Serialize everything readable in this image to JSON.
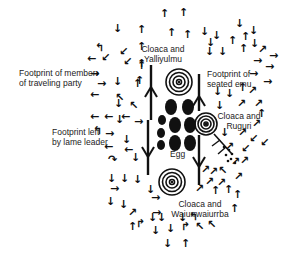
{
  "diagram": {
    "type": "annotated-figure",
    "background": "#ffffff",
    "ink": "#111111",
    "labels": [
      {
        "id": "member",
        "lines": [
          "Footprint of member",
          "of traveling party"
        ],
        "x": 19,
        "y": 75,
        "align": "left"
      },
      {
        "id": "yalliyulmu",
        "lines": [
          "Cloaca and",
          "Yalliyulmu"
        ],
        "x": 162,
        "y": 47,
        "align": "center"
      },
      {
        "id": "seated-emu",
        "lines": [
          "Footprint of",
          "seated emu"
        ],
        "x": 207,
        "y": 69,
        "align": "left"
      },
      {
        "id": "ruguri",
        "lines": [
          "Cloaca and",
          "Ruguri"
        ],
        "x": 228,
        "y": 112,
        "align": "center"
      },
      {
        "id": "lame-leader",
        "lines": [
          "Footprint left",
          "by lame leader"
        ],
        "x": 52,
        "y": 132,
        "align": "left"
      },
      {
        "id": "egg",
        "lines": [
          "Egg"
        ],
        "x": 172,
        "y": 153,
        "align": "left"
      },
      {
        "id": "wauirr",
        "lines": [
          "Cloaca and",
          "Waiurrwaiurrba"
        ],
        "x": 198,
        "y": 200,
        "align": "center"
      }
    ],
    "concentric_circles": [
      {
        "id": "yalliyulmu-cloaca",
        "cx": 179,
        "cy": 82,
        "r": 14,
        "rings": 4
      },
      {
        "id": "ruguri-cloaca",
        "cx": 206,
        "cy": 124,
        "r": 12,
        "rings": 4
      },
      {
        "id": "wauirr-cloaca",
        "cx": 172,
        "cy": 182,
        "r": 14,
        "rings": 4
      }
    ],
    "eggs": [
      {
        "cx": 171,
        "cy": 107,
        "rx": 6,
        "ry": 8
      },
      {
        "cx": 188,
        "cy": 107,
        "rx": 6,
        "ry": 8
      },
      {
        "cx": 162,
        "cy": 120,
        "rx": 4,
        "ry": 5
      },
      {
        "cx": 175,
        "cy": 125,
        "rx": 6,
        "ry": 8
      },
      {
        "cx": 190,
        "cy": 125,
        "rx": 6,
        "ry": 8
      },
      {
        "cx": 161,
        "cy": 133,
        "rx": 4,
        "ry": 5
      },
      {
        "cx": 175,
        "cy": 143,
        "rx": 6,
        "ry": 8
      },
      {
        "cx": 190,
        "cy": 143,
        "rx": 6,
        "ry": 8
      },
      {
        "cx": 161,
        "cy": 145,
        "rx": 4,
        "ry": 5
      }
    ],
    "emu_tracks": [
      {
        "x": 151,
        "y1": 65,
        "y2": 120,
        "dir": "up"
      },
      {
        "x": 199,
        "y1": 74,
        "y2": 111,
        "dir": "up"
      },
      {
        "x": 148,
        "y1": 120,
        "y2": 175,
        "dir": "down"
      },
      {
        "x": 199,
        "y1": 135,
        "y2": 185,
        "dir": "down"
      }
    ],
    "arrows": [
      {
        "g": "↓",
        "x": 118,
        "y": 29
      },
      {
        "g": "↑",
        "x": 142,
        "y": 30
      },
      {
        "g": "↑",
        "x": 165,
        "y": 14
      },
      {
        "g": "↑",
        "x": 184,
        "y": 13
      },
      {
        "g": "↰",
        "x": 100,
        "y": 48
      },
      {
        "g": "↙",
        "x": 124,
        "y": 52
      },
      {
        "g": "↑",
        "x": 142,
        "y": 47
      },
      {
        "g": "↑",
        "x": 172,
        "y": 33
      },
      {
        "g": "↑",
        "x": 188,
        "y": 35
      },
      {
        "g": "←",
        "x": 92,
        "y": 59
      },
      {
        "g": "↙",
        "x": 106,
        "y": 58
      },
      {
        "g": "↙",
        "x": 128,
        "y": 62
      },
      {
        "g": "↑",
        "x": 142,
        "y": 66
      },
      {
        "g": "→",
        "x": 95,
        "y": 74
      },
      {
        "g": "↑",
        "x": 140,
        "y": 81
      },
      {
        "g": "↑",
        "x": 142,
        "y": 64
      },
      {
        "g": "→",
        "x": 102,
        "y": 84
      },
      {
        "g": "↓",
        "x": 118,
        "y": 82
      },
      {
        "g": "↑",
        "x": 138,
        "y": 84
      },
      {
        "g": "←",
        "x": 95,
        "y": 95
      },
      {
        "g": "↖",
        "x": 120,
        "y": 98
      },
      {
        "g": "↓",
        "x": 119,
        "y": 104
      },
      {
        "g": "↖",
        "x": 134,
        "y": 106
      },
      {
        "g": "←",
        "x": 95,
        "y": 117
      },
      {
        "g": "←",
        "x": 109,
        "y": 117
      },
      {
        "g": "↓",
        "x": 120,
        "y": 120
      },
      {
        "g": "←",
        "x": 126,
        "y": 117
      },
      {
        "g": "→",
        "x": 139,
        "y": 122
      },
      {
        "g": "→",
        "x": 110,
        "y": 134
      },
      {
        "g": "↓",
        "x": 127,
        "y": 140
      },
      {
        "g": "←",
        "x": 109,
        "y": 147
      },
      {
        "g": "←",
        "x": 129,
        "y": 150
      },
      {
        "g": "↓",
        "x": 136,
        "y": 158
      },
      {
        "g": "↷",
        "x": 113,
        "y": 160
      },
      {
        "g": "↓",
        "x": 112,
        "y": 179
      },
      {
        "g": "↓",
        "x": 125,
        "y": 179
      },
      {
        "g": "↓",
        "x": 138,
        "y": 180
      },
      {
        "g": "→",
        "x": 115,
        "y": 189
      },
      {
        "g": "↓",
        "x": 111,
        "y": 202
      },
      {
        "g": "↓",
        "x": 124,
        "y": 205
      },
      {
        "g": "↗",
        "x": 133,
        "y": 213
      },
      {
        "g": "↑",
        "x": 133,
        "y": 227
      },
      {
        "g": "↱",
        "x": 141,
        "y": 224
      },
      {
        "g": "↓",
        "x": 205,
        "y": 32
      },
      {
        "g": "↓",
        "x": 217,
        "y": 36
      },
      {
        "g": "↓",
        "x": 240,
        "y": 24
      },
      {
        "g": "↓",
        "x": 254,
        "y": 31
      },
      {
        "g": "↓",
        "x": 211,
        "y": 43
      },
      {
        "g": "↑",
        "x": 233,
        "y": 41
      },
      {
        "g": "↑",
        "x": 246,
        "y": 37
      },
      {
        "g": "↓",
        "x": 255,
        "y": 44
      },
      {
        "g": "↓",
        "x": 210,
        "y": 52
      },
      {
        "g": "↓",
        "x": 223,
        "y": 52
      },
      {
        "g": "↑",
        "x": 244,
        "y": 49
      },
      {
        "g": "↗",
        "x": 263,
        "y": 50
      },
      {
        "g": "→",
        "x": 274,
        "y": 56
      },
      {
        "g": "→",
        "x": 258,
        "y": 61
      },
      {
        "g": "→",
        "x": 270,
        "y": 67
      },
      {
        "g": "→",
        "x": 254,
        "y": 74
      },
      {
        "g": "→",
        "x": 268,
        "y": 82
      },
      {
        "g": "↓",
        "x": 218,
        "y": 92
      },
      {
        "g": "↓",
        "x": 230,
        "y": 94
      },
      {
        "g": "↑",
        "x": 243,
        "y": 88
      },
      {
        "g": "↗",
        "x": 253,
        "y": 91
      },
      {
        "g": "↓",
        "x": 220,
        "y": 106
      },
      {
        "g": "↗",
        "x": 242,
        "y": 104
      },
      {
        "g": "↗",
        "x": 259,
        "y": 104
      },
      {
        "g": "↑",
        "x": 262,
        "y": 114
      },
      {
        "g": "↗",
        "x": 257,
        "y": 124
      },
      {
        "g": "↓",
        "x": 225,
        "y": 133
      },
      {
        "g": "↗",
        "x": 243,
        "y": 133
      },
      {
        "g": "↙",
        "x": 254,
        "y": 139
      },
      {
        "g": "↙",
        "x": 265,
        "y": 143
      },
      {
        "g": "↗",
        "x": 230,
        "y": 147
      },
      {
        "g": "↙",
        "x": 246,
        "y": 149
      },
      {
        "g": "↗",
        "x": 236,
        "y": 162
      },
      {
        "g": "↗",
        "x": 245,
        "y": 161
      },
      {
        "g": "↗",
        "x": 206,
        "y": 170
      },
      {
        "g": "↗",
        "x": 214,
        "y": 172
      },
      {
        "g": "↖",
        "x": 223,
        "y": 171
      },
      {
        "g": "↗",
        "x": 239,
        "y": 177
      },
      {
        "g": "↗",
        "x": 210,
        "y": 182
      },
      {
        "g": "↗",
        "x": 222,
        "y": 183
      },
      {
        "g": "↗",
        "x": 200,
        "y": 189
      },
      {
        "g": "↑",
        "x": 216,
        "y": 191
      },
      {
        "g": "↑",
        "x": 229,
        "y": 190
      },
      {
        "g": "↑",
        "x": 238,
        "y": 195
      },
      {
        "g": "↑",
        "x": 235,
        "y": 209
      },
      {
        "g": "↓",
        "x": 151,
        "y": 190
      },
      {
        "g": "→",
        "x": 156,
        "y": 198
      },
      {
        "g": "→",
        "x": 157,
        "y": 213
      },
      {
        "g": "↓",
        "x": 153,
        "y": 218
      },
      {
        "g": "↓",
        "x": 162,
        "y": 218
      },
      {
        "g": "↓",
        "x": 183,
        "y": 218
      },
      {
        "g": "↰",
        "x": 194,
        "y": 217
      },
      {
        "g": "↓",
        "x": 156,
        "y": 231
      },
      {
        "g": "↓",
        "x": 171,
        "y": 229
      },
      {
        "g": "↱",
        "x": 186,
        "y": 227
      },
      {
        "g": "↖",
        "x": 200,
        "y": 227
      },
      {
        "g": "↖",
        "x": 212,
        "y": 225
      },
      {
        "g": "↓",
        "x": 168,
        "y": 244
      },
      {
        "g": "↑",
        "x": 186,
        "y": 244
      }
    ],
    "leader_arrows": [
      {
        "id": "member-pointer",
        "g": "→",
        "x": 95,
        "y": 74
      },
      {
        "id": "lame-leader-pointer",
        "g": "↰",
        "x": 98,
        "y": 131
      }
    ],
    "seated_emu_print": {
      "x": 218,
      "y": 142,
      "dots": [
        [
          224,
          147
        ],
        [
          229,
          150
        ],
        [
          232,
          154
        ],
        [
          226,
          155
        ],
        [
          231,
          159
        ],
        [
          235,
          163
        ],
        [
          228,
          161
        ]
      ]
    }
  }
}
